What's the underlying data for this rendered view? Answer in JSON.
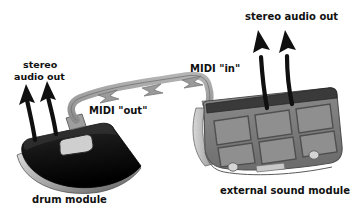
{
  "diagram": {
    "background_color": "#ffffff",
    "text_color": "#111111",
    "midi_cable_color": "#9a9a9a",
    "midi_cable_outline": "#6f6f6f",
    "audio_arrow_color": "#101010",
    "drum_module_body_color": "#1c1c1c",
    "drum_module_highlight_color": "#bdbdbd",
    "sound_module_body_color": "#7d7d7d",
    "sound_module_frame_color": "#5c5c5c",
    "sound_module_pad_color": "#8f8f8f",
    "sound_module_top_strip_color": "#3a3a3a"
  },
  "labels": {
    "left_audio_out_line1": "stereo",
    "left_audio_out_line2": "audio out",
    "midi_out": "MIDI \"out\"",
    "midi_in": "MIDI \"in\"",
    "right_audio_out": "stereo audio out",
    "drum_module_caption": "drum module",
    "sound_module_caption": "external sound module"
  },
  "devices": [
    {
      "id": "drum-module",
      "caption": "drum module",
      "ports": [
        "stereo audio out",
        "MIDI \"out\""
      ]
    },
    {
      "id": "external-sound-module",
      "caption": "external sound module",
      "ports": [
        "MIDI \"in\"",
        "stereo audio out"
      ],
      "pad_count": 6,
      "pad_rows": 2,
      "pad_columns": 3
    }
  ],
  "connections": [
    {
      "from": "drum-module",
      "from_port": "MIDI \"out\"",
      "to": "external-sound-module",
      "to_port": "MIDI \"in\"",
      "style": "thick-grey-arrow"
    }
  ]
}
